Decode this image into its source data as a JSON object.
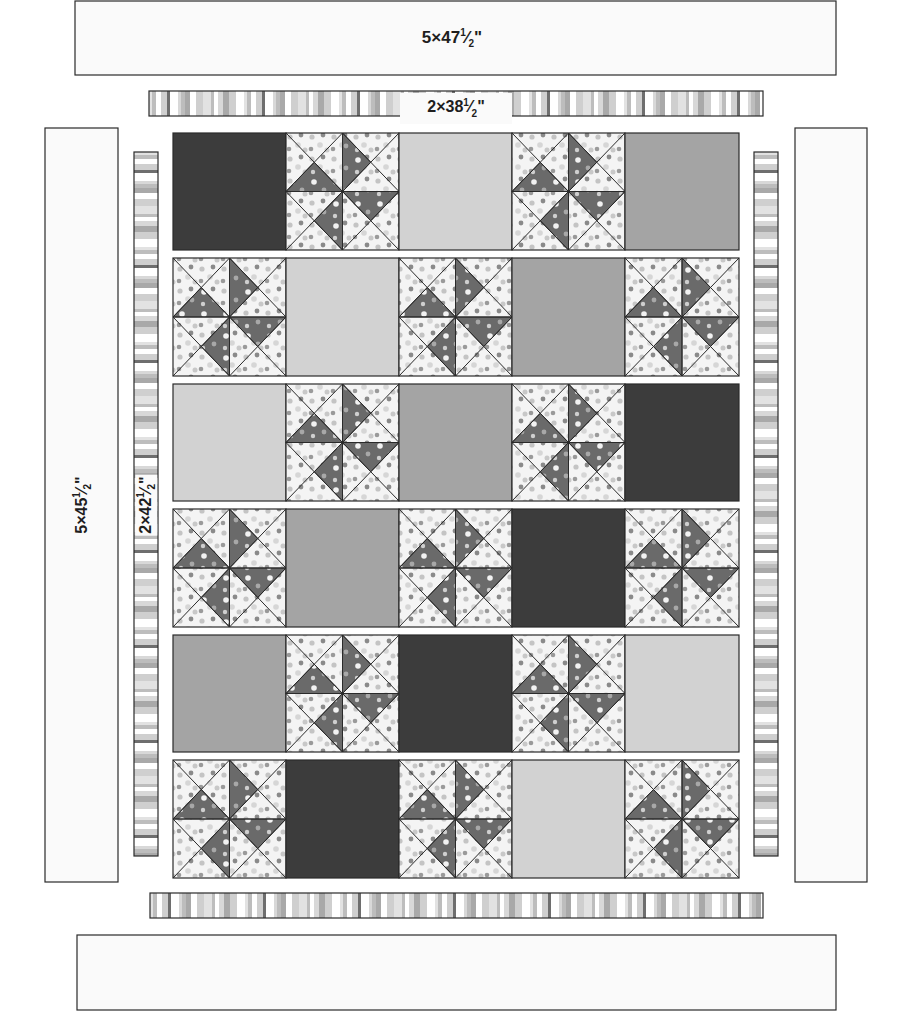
{
  "diagram": {
    "colors": {
      "dark": "#3c3c3c",
      "medium": "#a4a4a4",
      "light": "#d2d2d2",
      "print_background": "#f4f4f4",
      "pinwheel_dark": "#6a6a6a",
      "outline": "#2a2a2a",
      "border_fill": "#fafafa",
      "stripe_colors": [
        "#e2e2e2",
        "#bdbdbd",
        "#ffffff",
        "#cfcfcf",
        "#6e6e6e",
        "#d8d8d8",
        "#a9a9a9"
      ]
    },
    "borders": {
      "top_outer": {
        "label": "5×47½\"",
        "parts": [
          "5×47",
          "1",
          "2",
          "\""
        ]
      },
      "top_inner": {
        "label": "2×38½\"",
        "parts": [
          "2×38",
          "1",
          "2",
          "\""
        ]
      },
      "left_outer": {
        "label": "5×45½\"",
        "parts": [
          "5×45",
          "1",
          "2",
          "\""
        ]
      },
      "left_inner": {
        "label": "2×42½\"",
        "parts": [
          "2×42",
          "1",
          "2",
          "\""
        ]
      },
      "right_outer": {
        "label": ""
      },
      "right_inner": {
        "label": ""
      },
      "bottom_inner": {
        "label": ""
      },
      "bottom_outer": {
        "label": ""
      }
    },
    "block_legend": {
      "P": "pinwheel block",
      "D": "dark solid square",
      "M": "medium solid square",
      "L": "light solid square"
    },
    "rows": [
      [
        "D",
        "P",
        "L",
        "P",
        "M"
      ],
      [
        "P",
        "L",
        "P",
        "M",
        "P"
      ],
      [
        "L",
        "P",
        "M",
        "P",
        "D"
      ],
      [
        "P",
        "M",
        "P",
        "D",
        "P"
      ],
      [
        "M",
        "P",
        "D",
        "P",
        "L"
      ],
      [
        "P",
        "D",
        "P",
        "L",
        "P"
      ]
    ]
  }
}
